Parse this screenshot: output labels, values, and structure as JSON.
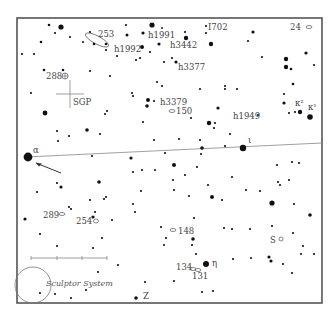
{
  "chart_data": {
    "type": "star-chart",
    "frame": {
      "x": 17,
      "y": 18,
      "width": 305,
      "height": 285
    },
    "ecliptic_line": {
      "x1": 26,
      "y1": 157,
      "x2": 322,
      "y2": 143
    },
    "arrow": {
      "x1": 61,
      "y1": 173,
      "x2": 36,
      "y2": 163
    },
    "sgp_cross": {
      "x": 70,
      "y": 94,
      "size": 14
    },
    "scale_bar": {
      "x1": 31,
      "x2": 107,
      "y": 258,
      "ticks": [
        31,
        57,
        82,
        107
      ]
    },
    "labels": [
      {
        "text": "253",
        "x": 98,
        "y": 37
      },
      {
        "text": "h1991",
        "x": 148,
        "y": 38
      },
      {
        "text": "I702",
        "x": 208,
        "y": 30
      },
      {
        "text": "24",
        "x": 290,
        "y": 30
      },
      {
        "text": "h1992",
        "x": 114,
        "y": 52
      },
      {
        "text": "h3442",
        "x": 170,
        "y": 48
      },
      {
        "text": "288",
        "x": 46,
        "y": 79
      },
      {
        "text": "h3377",
        "x": 178,
        "y": 70
      },
      {
        "text": "SGP",
        "x": 73,
        "y": 105
      },
      {
        "text": "h3379",
        "x": 160,
        "y": 105
      },
      {
        "text": "150",
        "x": 176,
        "y": 114
      },
      {
        "text": "h1949",
        "x": 233,
        "y": 119
      },
      {
        "text": "κ²",
        "x": 295,
        "y": 106
      },
      {
        "text": "κ¹",
        "x": 308,
        "y": 110
      },
      {
        "text": "α",
        "x": 33,
        "y": 153
      },
      {
        "text": "ι",
        "x": 248,
        "y": 143
      },
      {
        "text": "289",
        "x": 43,
        "y": 218
      },
      {
        "text": "254",
        "x": 76,
        "y": 224
      },
      {
        "text": "148",
        "x": 178,
        "y": 234
      },
      {
        "text": "S",
        "x": 270,
        "y": 243
      },
      {
        "text": "η",
        "x": 212,
        "y": 266
      },
      {
        "text": "134",
        "x": 176,
        "y": 270
      },
      {
        "text": "131",
        "x": 192,
        "y": 279
      },
      {
        "text": "Z",
        "x": 143,
        "y": 299
      }
    ],
    "galaxy_label": {
      "text": "Sculptor System",
      "x": 46,
      "y": 286
    },
    "galaxy_circle": {
      "cx": 33,
      "cy": 285,
      "r": 18
    },
    "deep_sky": [
      {
        "type": "ellipse",
        "cx": 97,
        "cy": 40,
        "rx": 13,
        "ry": 4,
        "rot": 28
      },
      {
        "type": "ellipse",
        "cx": 309,
        "cy": 27,
        "rx": 3,
        "ry": 1.5,
        "rot": 0
      },
      {
        "type": "ellipse",
        "cx": 172,
        "cy": 111,
        "rx": 3,
        "ry": 1.5,
        "rot": 0
      },
      {
        "type": "ellipse",
        "cx": 62,
        "cy": 214,
        "rx": 3,
        "ry": 1.5,
        "rot": 0
      },
      {
        "type": "ellipse",
        "cx": 96,
        "cy": 221,
        "rx": 2.5,
        "ry": 2,
        "rot": 0
      },
      {
        "type": "ellipse",
        "cx": 173,
        "cy": 230,
        "rx": 3,
        "ry": 1.5,
        "rot": 0
      },
      {
        "type": "circle",
        "cx": 281,
        "cy": 239,
        "r": 2
      },
      {
        "type": "ellipse",
        "cx": 193,
        "cy": 269,
        "rx": 3,
        "ry": 1.5,
        "rot": 0
      },
      {
        "type": "ellipse",
        "cx": 198,
        "cy": 270,
        "rx": 3,
        "ry": 1.5,
        "rot": 0
      },
      {
        "type": "globular",
        "cx": 65,
        "cy": 76,
        "r": 3
      }
    ],
    "stars": [
      [
        49,
        25,
        1.3
      ],
      [
        61,
        27,
        2.6
      ],
      [
        55,
        33,
        1.1
      ],
      [
        70,
        37,
        1.1
      ],
      [
        41,
        42,
        1.3
      ],
      [
        22,
        54,
        1.1
      ],
      [
        34,
        54,
        1.1
      ],
      [
        90,
        32,
        1.1
      ],
      [
        83,
        42,
        1.1
      ],
      [
        94,
        44,
        1.3
      ],
      [
        106,
        44,
        1.3
      ],
      [
        106,
        50,
        1.1
      ],
      [
        117,
        56,
        1.1
      ],
      [
        126,
        25,
        1.1
      ],
      [
        152,
        25,
        2.6
      ],
      [
        162,
        28,
        0.9
      ],
      [
        127,
        35,
        1.5
      ],
      [
        143,
        33,
        1.6
      ],
      [
        159,
        44,
        1.6
      ],
      [
        142,
        47,
        2.0
      ],
      [
        150,
        52,
        1.1
      ],
      [
        136,
        60,
        1.1
      ],
      [
        140,
        58,
        1.1
      ],
      [
        164,
        62,
        1.1
      ],
      [
        172,
        58,
        1.1
      ],
      [
        185,
        32,
        1.1
      ],
      [
        206,
        33,
        1.1
      ],
      [
        186,
        38,
        2.2
      ],
      [
        206,
        26,
        1.1
      ],
      [
        211,
        44,
        2.2
      ],
      [
        253,
        32,
        1.6
      ],
      [
        248,
        41,
        1.1
      ],
      [
        176,
        62,
        1.6
      ],
      [
        262,
        57,
        1.1
      ],
      [
        286,
        59,
        2.2
      ],
      [
        286,
        67,
        2.2
      ],
      [
        291,
        69,
        1.3
      ],
      [
        306,
        53,
        1.6
      ],
      [
        314,
        65,
        1.1
      ],
      [
        293,
        84,
        1.3
      ],
      [
        44,
        70,
        1.3
      ],
      [
        63,
        70,
        1.3
      ],
      [
        90,
        71,
        1.1
      ],
      [
        110,
        76,
        1.1
      ],
      [
        157,
        82,
        1.1
      ],
      [
        162,
        86,
        1.1
      ],
      [
        148,
        100,
        2.0
      ],
      [
        154,
        101,
        1.1
      ],
      [
        31,
        93,
        1.1
      ],
      [
        132,
        93,
        1.1
      ],
      [
        133,
        96,
        1.1
      ],
      [
        147,
        106,
        1.8
      ],
      [
        107,
        111,
        1.1
      ],
      [
        105,
        114,
        1.1
      ],
      [
        45,
        113,
        2.4
      ],
      [
        200,
        89,
        1.1
      ],
      [
        225,
        89,
        1.1
      ],
      [
        225,
        86,
        1.1
      ],
      [
        237,
        89,
        1.1
      ],
      [
        284,
        94,
        1.1
      ],
      [
        284,
        103,
        1.6
      ],
      [
        218,
        108,
        1.6
      ],
      [
        191,
        118,
        1.1
      ],
      [
        289,
        113,
        1.1
      ],
      [
        295,
        112,
        1.1
      ],
      [
        300,
        112,
        2.2
      ],
      [
        310,
        117,
        2.8
      ],
      [
        258,
        115,
        1.1
      ],
      [
        209,
        123,
        2.2
      ],
      [
        215,
        123,
        1.1
      ],
      [
        214,
        128,
        1.1
      ],
      [
        230,
        134,
        1.1
      ],
      [
        143,
        122,
        1.1
      ],
      [
        57,
        131,
        1.1
      ],
      [
        58,
        141,
        1.1
      ],
      [
        69,
        136,
        1.1
      ],
      [
        87,
        130,
        1.8
      ],
      [
        100,
        134,
        1.1
      ],
      [
        154,
        140,
        1.1
      ],
      [
        179,
        139,
        1.1
      ],
      [
        200,
        140,
        1.1
      ],
      [
        202,
        148,
        1.8
      ],
      [
        201,
        154,
        1.1
      ],
      [
        225,
        146,
        1.1
      ],
      [
        243,
        148,
        3.2
      ],
      [
        28,
        157,
        4.4
      ],
      [
        92,
        156,
        1.1
      ],
      [
        131,
        158,
        1.6
      ],
      [
        165,
        153,
        1.1
      ],
      [
        173,
        180,
        1.1
      ],
      [
        133,
        172,
        1.1
      ],
      [
        142,
        170,
        1.1
      ],
      [
        155,
        170,
        1.1
      ],
      [
        174,
        165,
        2.0
      ],
      [
        57,
        183,
        1.1
      ],
      [
        61,
        187,
        1.6
      ],
      [
        99,
        182,
        1.8
      ],
      [
        37,
        192,
        1.1
      ],
      [
        141,
        191,
        1.1
      ],
      [
        90,
        200,
        1.1
      ],
      [
        104,
        199,
        1.1
      ],
      [
        106,
        197,
        1.1
      ],
      [
        69,
        207,
        1.1
      ],
      [
        71,
        209,
        1.1
      ],
      [
        133,
        204,
        1.1
      ],
      [
        135,
        212,
        1.1
      ],
      [
        95,
        212,
        1.1
      ],
      [
        93,
        217,
        1.6
      ],
      [
        112,
        220,
        1.1
      ],
      [
        25,
        219,
        1.6
      ],
      [
        40,
        234,
        1.1
      ],
      [
        102,
        238,
        1.1
      ],
      [
        161,
        227,
        1.1
      ],
      [
        57,
        246,
        1.1
      ],
      [
        93,
        248,
        1.1
      ],
      [
        174,
        190,
        1.1
      ],
      [
        212,
        197,
        2.0
      ],
      [
        222,
        200,
        1.1
      ],
      [
        232,
        177,
        1.1
      ],
      [
        246,
        190,
        1.1
      ],
      [
        260,
        191,
        1.1
      ],
      [
        278,
        182,
        1.1
      ],
      [
        185,
        175,
        1.1
      ],
      [
        197,
        167,
        1.1
      ],
      [
        208,
        185,
        1.1
      ],
      [
        189,
        196,
        1.1
      ],
      [
        194,
        218,
        1.1
      ],
      [
        232,
        229,
        1.1
      ],
      [
        250,
        229,
        1.1
      ],
      [
        224,
        228,
        1.1
      ],
      [
        166,
        238,
        1.1
      ],
      [
        272,
        203,
        2.6
      ],
      [
        280,
        185,
        1.1
      ],
      [
        294,
        204,
        1.1
      ],
      [
        289,
        180,
        1.1
      ],
      [
        310,
        215,
        1.8
      ],
      [
        277,
        165,
        1.1
      ],
      [
        292,
        162,
        1.1
      ],
      [
        299,
        163,
        1.1
      ],
      [
        272,
        226,
        1.1
      ],
      [
        293,
        233,
        1.1
      ],
      [
        193,
        239,
        1.8
      ],
      [
        164,
        245,
        1.1
      ],
      [
        192,
        245,
        1.1
      ],
      [
        303,
        246,
        1.1
      ],
      [
        196,
        254,
        1.1
      ],
      [
        233,
        259,
        1.1
      ],
      [
        251,
        258,
        1.1
      ],
      [
        269,
        257,
        1.6
      ],
      [
        271,
        261,
        1.6
      ],
      [
        283,
        264,
        1.1
      ],
      [
        301,
        254,
        1.1
      ],
      [
        314,
        254,
        1.1
      ],
      [
        292,
        273,
        1.1
      ],
      [
        206,
        264,
        3.0
      ],
      [
        174,
        281,
        1.1
      ],
      [
        202,
        292,
        1.1
      ],
      [
        213,
        291,
        1.1
      ],
      [
        118,
        265,
        1.1
      ],
      [
        98,
        272,
        1.1
      ],
      [
        145,
        282,
        1.1
      ],
      [
        40,
        293,
        1.1
      ],
      [
        55,
        294,
        1.1
      ],
      [
        71,
        298,
        1.1
      ],
      [
        86,
        290,
        1.1
      ],
      [
        136,
        298,
        1.8
      ]
    ]
  }
}
